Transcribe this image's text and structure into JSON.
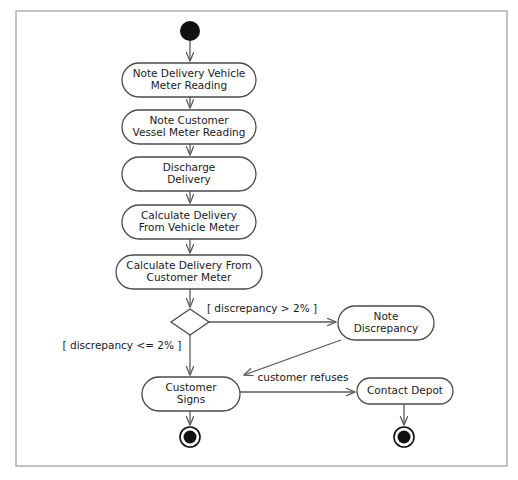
{
  "diagram": {
    "type": "uml-activity-diagram",
    "frame": {
      "x": 16,
      "y": 11,
      "width": 491,
      "height": 455,
      "border_color": "#a8a8a8"
    },
    "colors": {
      "node_stroke": "#4a4a4a",
      "node_fill": "#ffffff",
      "edge_stroke": "#5a5a5a",
      "text": "#1a1a1a",
      "terminal": "#111111",
      "background": "#ffffff"
    },
    "initial_node": {
      "cx": 190,
      "cy": 31,
      "r": 10
    },
    "activities": [
      {
        "id": "note-delivery-vehicle-meter-reading",
        "lines": [
          "Note Delivery Vehicle",
          "Meter Reading"
        ],
        "x": 122,
        "y": 63,
        "width": 134,
        "height": 34
      },
      {
        "id": "note-customer-vessel-meter-reading",
        "lines": [
          "Note Customer",
          "Vessel Meter Reading"
        ],
        "x": 122,
        "y": 110,
        "width": 134,
        "height": 34
      },
      {
        "id": "discharge-delivery",
        "lines": [
          "Discharge",
          "Delivery"
        ],
        "x": 122,
        "y": 157,
        "width": 134,
        "height": 34
      },
      {
        "id": "calculate-delivery-from-vehicle-meter",
        "lines": [
          "Calculate Delivery",
          "From Vehicle Meter"
        ],
        "x": 122,
        "y": 205,
        "width": 134,
        "height": 34
      },
      {
        "id": "calculate-delivery-from-customer-meter",
        "lines": [
          "Calculate Delivery From",
          "Customer Meter"
        ],
        "x": 116,
        "y": 255,
        "width": 146,
        "height": 34
      },
      {
        "id": "note-discrepancy",
        "lines": [
          "Note",
          "Discrepancy"
        ],
        "x": 338,
        "y": 306,
        "width": 96,
        "height": 34
      },
      {
        "id": "customer-signs",
        "lines": [
          "Customer",
          "Signs"
        ],
        "x": 142,
        "y": 377,
        "width": 98,
        "height": 34
      },
      {
        "id": "contact-depot",
        "lines": [
          "Contact Depot"
        ],
        "x": 357,
        "y": 378,
        "width": 96,
        "height": 26
      }
    ],
    "decision": {
      "id": "discrepancy-decision",
      "cx": 190,
      "cy": 322,
      "rx": 19,
      "ry": 13
    },
    "final_nodes": [
      {
        "id": "final-node-customer-signs",
        "cx": 190,
        "cy": 437,
        "r_outer": 10,
        "r_inner": 6.5
      },
      {
        "id": "final-node-contact-depot",
        "cx": 404,
        "cy": 437,
        "r_outer": 10,
        "r_inner": 6.5
      }
    ],
    "guards": [
      {
        "id": "guard-discrepancy-greater",
        "text": "[ discrepancy > 2% ]",
        "x": 262,
        "y": 309
      },
      {
        "id": "guard-discrepancy-less-equal",
        "text": "[ discrepancy <= 2% ]",
        "x": 122,
        "y": 346
      }
    ],
    "edge_labels": [
      {
        "id": "edge-label-customer-refuses",
        "text": "customer refuses",
        "x": 303,
        "y": 378
      }
    ],
    "edges": [
      {
        "id": "edge-initial-to-note-vehicle",
        "from": "initial",
        "to": "note-delivery-vehicle-meter-reading",
        "path": "M 190 41 L 190 61"
      },
      {
        "id": "edge-note-vehicle-to-note-customer",
        "from": "note-delivery-vehicle-meter-reading",
        "to": "note-customer-vessel-meter-reading",
        "path": "M 190 97 L 190 108"
      },
      {
        "id": "edge-note-customer-to-discharge",
        "from": "note-customer-vessel-meter-reading",
        "to": "discharge-delivery",
        "path": "M 190 144 L 190 155"
      },
      {
        "id": "edge-discharge-to-calc-vehicle",
        "from": "discharge-delivery",
        "to": "calculate-delivery-from-vehicle-meter",
        "path": "M 190 191 L 190 203"
      },
      {
        "id": "edge-calc-vehicle-to-calc-customer",
        "from": "calculate-delivery-from-vehicle-meter",
        "to": "calculate-delivery-from-customer-meter",
        "path": "M 190 239 L 190 253"
      },
      {
        "id": "edge-calc-customer-to-decision",
        "from": "calculate-delivery-from-customer-meter",
        "to": "discrepancy-decision",
        "path": "M 190 289 L 190 307"
      },
      {
        "id": "edge-decision-to-note-discrepancy",
        "from": "discrepancy-decision",
        "to": "note-discrepancy",
        "path": "M 209 322 L 336 322"
      },
      {
        "id": "edge-decision-to-customer-signs",
        "from": "discrepancy-decision",
        "to": "customer-signs",
        "path": "M 190 335 L 190 375"
      },
      {
        "id": "edge-note-discrepancy-to-customer-signs",
        "from": "note-discrepancy",
        "to": "customer-signs",
        "path": "M 341 340 L 244 375"
      },
      {
        "id": "edge-customer-signs-to-contact-depot",
        "from": "customer-signs",
        "to": "contact-depot",
        "path": "M 240 392 L 355 392"
      },
      {
        "id": "edge-customer-signs-to-final",
        "from": "customer-signs",
        "to": "final-node-customer-signs",
        "path": "M 190 411 L 190 425"
      },
      {
        "id": "edge-contact-depot-to-final",
        "from": "contact-depot",
        "to": "final-node-contact-depot",
        "path": "M 404 404 L 404 425"
      }
    ]
  }
}
